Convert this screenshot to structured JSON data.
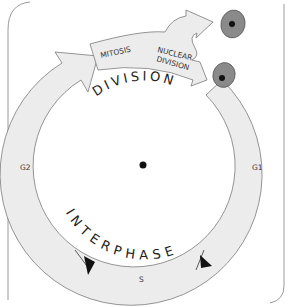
{
  "colors": {
    "ring_fill": "#ececec",
    "ring_stroke": "#7a7a7a",
    "cell_fill": "#8a8a8a",
    "cell_stroke": "#5a5a5a",
    "nucleus": "#111111",
    "frame": "#9a9a9a",
    "text": "#333333"
  },
  "phases": {
    "division": "DIVISION",
    "interphase": "INTERPHASE"
  },
  "division_band": {
    "mitosis": "MITOSIS",
    "nuclear_line1": "NUCLEAR",
    "nuclear_line2": "DIVISION"
  },
  "ring_labels": {
    "g1": "G1",
    "s": "S",
    "g2": "G2"
  },
  "cells": [
    {
      "name": "daughter-cell-top"
    },
    {
      "name": "daughter-cell-bottom"
    }
  ]
}
